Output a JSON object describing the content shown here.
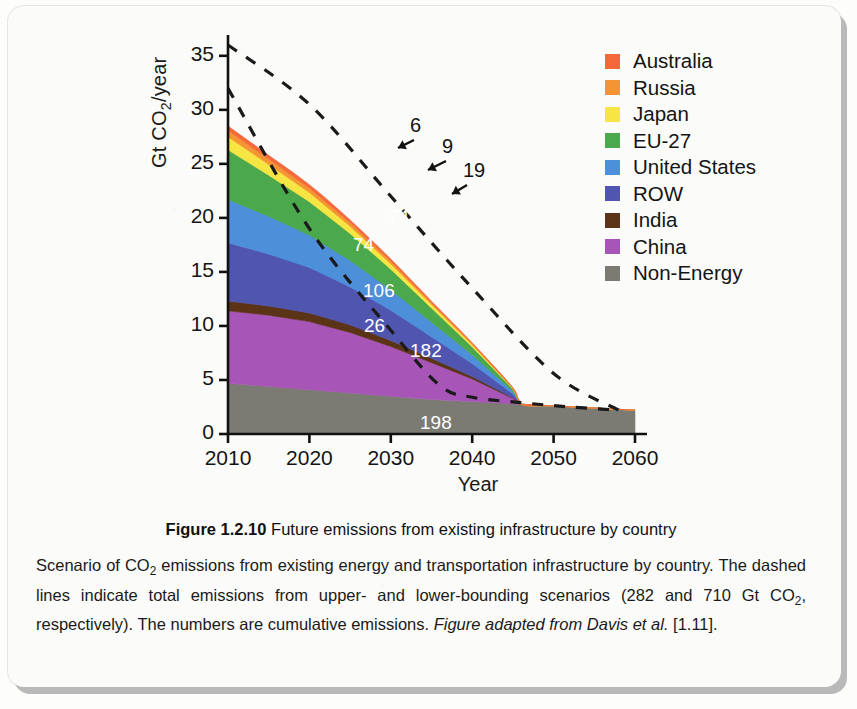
{
  "figure": {
    "label": "Figure 1.2.10",
    "title": "Future emissions from existing infrastructure by country",
    "caption_part1": "Scenario of CO",
    "caption_sub1": "2",
    "caption_part2": " emissions from existing energy and transportation infrastructure by country. The dashed lines indicate total emissions from upper- and lower-bounding scenarios (282 and 710 Gt CO",
    "caption_sub2": "2",
    "caption_part3": ", respectively). The numbers are cumulative emissions. ",
    "caption_italic": "Figure adapted from Davis et al.",
    "caption_part4": " [1.11]."
  },
  "chart_data": {
    "type": "area",
    "title": "",
    "xlabel": "Year",
    "ylabel": "Gt CO2/year",
    "ylabel_parts": {
      "pre": "Gt CO",
      "sub": "2",
      "post": "/year"
    },
    "xlim": [
      2010,
      2060
    ],
    "ylim": [
      0,
      36
    ],
    "xticks": [
      2010,
      2020,
      2030,
      2040,
      2050,
      2060
    ],
    "yticks": [
      0,
      5,
      10,
      15,
      20,
      25,
      30,
      35
    ],
    "grid": false,
    "legend_position": "upper-right",
    "x": [
      2010,
      2015,
      2020,
      2025,
      2030,
      2035,
      2040,
      2045,
      2046,
      2050,
      2055,
      2060
    ],
    "series": [
      {
        "name": "Non-Energy",
        "color": "#7c7b73",
        "values": [
          4.7,
          4.4,
          4.1,
          3.8,
          3.5,
          3.2,
          3.0,
          2.8,
          2.75,
          2.6,
          2.4,
          2.2
        ],
        "cumulative_label": "198"
      },
      {
        "name": "China",
        "color": "#a855b8",
        "values": [
          6.7,
          6.6,
          6.3,
          5.6,
          4.6,
          3.4,
          2.1,
          0.5,
          0.0,
          0.0,
          0.0,
          0.0
        ],
        "cumulative_label": "182"
      },
      {
        "name": "India",
        "color": "#5b3418",
        "values": [
          0.9,
          0.85,
          0.8,
          0.7,
          0.55,
          0.4,
          0.22,
          0.05,
          0.0,
          0.0,
          0.0,
          0.0
        ],
        "cumulative_label": "26"
      },
      {
        "name": "ROW",
        "color": "#5055b0",
        "values": [
          5.4,
          4.8,
          4.2,
          3.5,
          2.8,
          2.0,
          1.2,
          0.35,
          0.0,
          0.0,
          0.0,
          0.0
        ],
        "cumulative_label": "106"
      },
      {
        "name": "United States",
        "color": "#4e8fda",
        "values": [
          4.0,
          3.5,
          3.0,
          2.45,
          1.9,
          1.35,
          0.8,
          0.25,
          0.0,
          0.0,
          0.0,
          0.0
        ],
        "cumulative_label": "74"
      },
      {
        "name": "EU-27",
        "color": "#4ca84c",
        "values": [
          4.6,
          3.8,
          3.1,
          2.5,
          1.9,
          1.3,
          0.75,
          0.22,
          0.0,
          0.0,
          0.0,
          0.0
        ],
        "cumulative_label": "74"
      },
      {
        "name": "Japan",
        "color": "#f7e543",
        "values": [
          1.2,
          1.0,
          0.85,
          0.68,
          0.5,
          0.34,
          0.2,
          0.06,
          0.0,
          0.0,
          0.0,
          0.0
        ],
        "cumulative_label": "19"
      },
      {
        "name": "Russia",
        "color": "#f59433",
        "values": [
          0.6,
          0.5,
          0.42,
          0.34,
          0.26,
          0.18,
          0.1,
          0.03,
          0.0,
          0.0,
          0.0,
          0.0
        ],
        "cumulative_label": "9"
      },
      {
        "name": "Australia",
        "color": "#f4683a",
        "values": [
          0.4,
          0.35,
          0.3,
          0.24,
          0.18,
          0.12,
          0.07,
          0.02,
          0.0,
          0.0,
          0.0,
          0.0
        ],
        "cumulative_label": "6"
      }
    ],
    "dashed_lines": [
      {
        "name": "upper-bounding scenario",
        "total_gt": 710,
        "x": [
          2010,
          2020,
          2030,
          2040,
          2050,
          2058
        ],
        "y": [
          36.0,
          30.5,
          22.0,
          13.5,
          5.6,
          2.2
        ]
      },
      {
        "name": "lower-bounding scenario",
        "total_gt": 282,
        "x": [
          2010,
          2020,
          2030,
          2036,
          2040,
          2046,
          2052,
          2058
        ],
        "y": [
          32.0,
          19.0,
          9.6,
          4.5,
          3.4,
          2.9,
          2.5,
          2.2
        ]
      }
    ],
    "annotations": [
      {
        "text": "6",
        "label_x": 290,
        "label_y": 96,
        "tip_x": 278,
        "tip_y": 130
      },
      {
        "text": "9",
        "label_x": 322,
        "label_y": 117,
        "tip_x": 308,
        "tip_y": 152
      },
      {
        "text": "19",
        "label_x": 343,
        "label_y": 141,
        "tip_x": 332,
        "tip_y": 176
      }
    ],
    "inline_labels": [
      {
        "text": "74",
        "x": 268,
        "y": 188,
        "series": "EU-27"
      },
      {
        "text": "74",
        "x": 233,
        "y": 216,
        "series": "United States"
      },
      {
        "text": "106",
        "x": 243,
        "y": 262,
        "series": "ROW"
      },
      {
        "text": "26",
        "x": 244,
        "y": 297,
        "series": "India"
      },
      {
        "text": "182",
        "x": 290,
        "y": 322,
        "series": "China"
      },
      {
        "text": "198",
        "x": 300,
        "y": 394,
        "series": "Non-Energy"
      }
    ]
  },
  "legend": {
    "items": [
      {
        "label": "Australia",
        "color": "#f4683a"
      },
      {
        "label": "Russia",
        "color": "#f59433"
      },
      {
        "label": "Japan",
        "color": "#f7e543"
      },
      {
        "label": "EU-27",
        "color": "#4ca84c"
      },
      {
        "label": "United States",
        "color": "#4e8fda"
      },
      {
        "label": "ROW",
        "color": "#5055b0"
      },
      {
        "label": "India",
        "color": "#5b3418"
      },
      {
        "label": "China",
        "color": "#a855b8"
      },
      {
        "label": "Non-Energy",
        "color": "#7c7b73"
      }
    ]
  }
}
